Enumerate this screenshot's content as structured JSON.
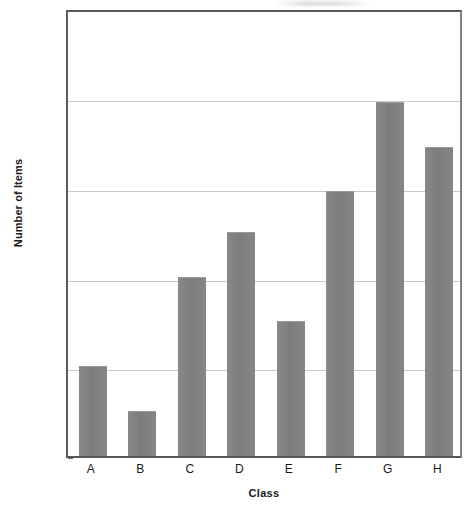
{
  "chart_data": {
    "type": "bar",
    "title": "",
    "xlabel": "Class",
    "ylabel": "Number of Items",
    "categories": [
      "A",
      "B",
      "C",
      "D",
      "E",
      "F",
      "G",
      "H"
    ],
    "values": [
      120,
      110,
      140,
      150,
      130,
      159,
      179,
      169
    ],
    "ylim": [
      100,
      200
    ],
    "ytick_labels": [
      "100",
      "120",
      "140",
      "160",
      "180"
    ],
    "ytick_values": [
      100,
      120,
      140,
      160,
      180
    ],
    "grid": true,
    "legend": null,
    "bar_color": "#808080",
    "gridline_color": "#c9c9c9",
    "axis_color": "#555b5e",
    "background_color": "#ffffff"
  }
}
